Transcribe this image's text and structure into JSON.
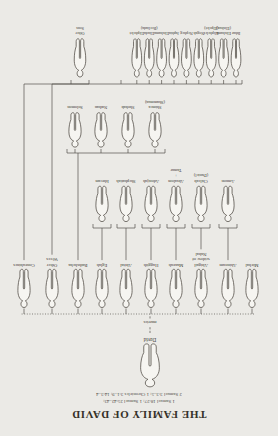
{
  "title": "THE FAMILY OF DAVID",
  "references": [
    "1 Samuel 18:27; 1 Samuel 25:42–43;",
    "2 Samuel 3:3–5; 1 Chronicles 3:1–9; 14:3–4"
  ],
  "root": {
    "name": "David"
  },
  "marriage_label": "marries",
  "wives": [
    {
      "lines": [
        "Michal"
      ]
    },
    {
      "lines": [
        "Ahinoam"
      ]
    },
    {
      "lines": [
        "Abigail",
        "widow of",
        "Nabal"
      ]
    },
    {
      "lines": [
        "Maacah"
      ]
    },
    {
      "lines": [
        "Haggith"
      ]
    },
    {
      "lines": [
        "Abital"
      ]
    },
    {
      "lines": [
        "Eglah"
      ]
    },
    {
      "lines": [
        "Bathsheba"
      ]
    },
    {
      "lines": [
        "Other",
        "Wives"
      ]
    },
    {
      "lines": [
        "Concubines"
      ]
    }
  ],
  "single_children": [
    {
      "lines": [
        "Amnon"
      ]
    },
    {
      "lines": [
        "Chileab",
        "(Daniel)"
      ]
    },
    {
      "lines": [
        "Absalom",
        "+",
        "Tamar"
      ]
    },
    {
      "lines": [
        "Adonijah"
      ]
    },
    {
      "lines": [
        "Shephatiah"
      ]
    },
    {
      "lines": [
        "Ithream"
      ]
    }
  ],
  "bathsheba_children": [
    {
      "lines": [
        "Shimea",
        "(Shammua)"
      ]
    },
    {
      "lines": [
        "Shobab"
      ]
    },
    {
      "lines": [
        "Nathan"
      ]
    },
    {
      "lines": [
        "Solomon"
      ]
    }
  ],
  "other_wives_children": [
    {
      "lines": [
        "Ibhar"
      ]
    },
    {
      "lines": [
        "Elishama",
        "(Elishua)"
      ]
    },
    {
      "lines": [
        "Eliphelet",
        "(Elpelet)"
      ]
    },
    {
      "lines": [
        "Nogah"
      ]
    },
    {
      "lines": [
        "Nepheg"
      ]
    },
    {
      "lines": [
        "Japhia"
      ]
    },
    {
      "lines": [
        "Elishama"
      ]
    },
    {
      "lines": [
        "Eliada",
        "(Beeliada)"
      ]
    },
    {
      "lines": [
        "Eliphelet"
      ]
    }
  ],
  "concubines_children": [
    {
      "lines": [
        "Other",
        "Sons"
      ]
    }
  ],
  "colors": {
    "paper": "#ebeae6",
    "ink": "#3a3731",
    "line": "#55514a",
    "figure_fill": "#f6f5f1"
  }
}
